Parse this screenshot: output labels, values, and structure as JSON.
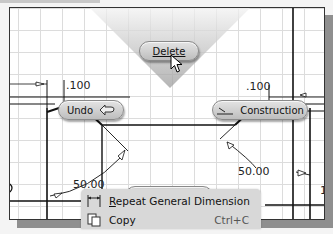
{
  "marking_menu": {
    "delete": {
      "label": "Delete",
      "icon": "pointer-cursor-icon"
    },
    "undo": {
      "label": "Undo",
      "icon": "undo-arrow-icon"
    },
    "construction": {
      "label": "Construction",
      "icon": "construction-line-icon"
    },
    "centerline": {
      "label": "Centerline",
      "icon": "centerline-icon"
    }
  },
  "dimensions": {
    "top_left": ".100",
    "top_right": ".100",
    "bottom_left": "50.00",
    "bottom_right": "50.00",
    "right_edge": "1"
  },
  "context_menu": {
    "items": [
      {
        "label_prefix": "",
        "label_underlined": "R",
        "label_rest": "epeat General Dimension",
        "shortcut": "",
        "icon": "general-dimension-icon"
      },
      {
        "label_prefix": "",
        "label_underlined": "",
        "label_rest": "Copy",
        "shortcut": "Ctrl+C",
        "icon": "copy-icon"
      }
    ]
  },
  "colors": {
    "canvas_bg": "#ffffff",
    "grid": "#dcdcdc",
    "geometry": "#111111",
    "pill_bg": "#cfcfcf",
    "wedge": "#b0b0b0",
    "menu_bg": "#d8d8d8"
  }
}
